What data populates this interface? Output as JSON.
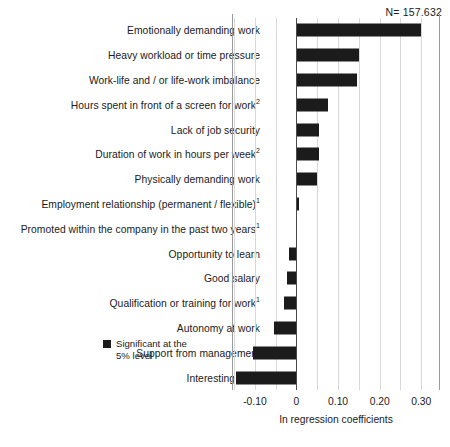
{
  "sample_note": "N= 157.632",
  "legend": {
    "label": "Significant at the 5% level",
    "color": "#1b1b1b"
  },
  "axis": {
    "x_title": "In regression coefficients",
    "x_ticks": [
      "-0.10",
      "0",
      "0.10",
      "0.20",
      "0.30"
    ]
  },
  "chart_data": {
    "type": "bar",
    "orientation": "horizontal",
    "title": "",
    "subtitle": "",
    "xlabel": "In regression coefficients",
    "ylabel": "",
    "xlim": [
      -0.155,
      0.345
    ],
    "xticks": [
      -0.1,
      0,
      0.1,
      0.2,
      0.3
    ],
    "xtick_labels": [
      "-0.10",
      "0",
      "0.10",
      "0.20",
      "0.30"
    ],
    "grid": true,
    "grid_axis": "x",
    "minor_grid_step": 0.05,
    "legend_entries": [
      "Significant at the 5% level"
    ],
    "legend_position": "bottom-right-inside",
    "annotations": [
      "N= 157.632"
    ],
    "footnote_markers": {
      "1": "superscript 1",
      "2": "superscript 2"
    },
    "bar_color": "#1b1b1b",
    "categories": [
      "Emotionally demanding work",
      "Heavy workload or time pressure",
      "Work-life and / or life-work imbalance",
      "Hours spent in front of a screen for work²",
      "Lack of job security",
      "Duration of work in hours per week²",
      "Physically demanding work",
      "Employment relationship (permanent / flexible)¹",
      "Promoted within the company in the past two years¹",
      "Opportunity to learn",
      "Good salary",
      "Qualification or training for work¹",
      "Autonomy at work",
      "Support from management",
      "Interesting work"
    ],
    "values": [
      0.3,
      0.15,
      0.145,
      0.075,
      0.055,
      0.055,
      0.05,
      0.005,
      0.0,
      -0.017,
      -0.024,
      -0.03,
      -0.055,
      -0.105,
      -0.145
    ],
    "significant": [
      true,
      true,
      true,
      true,
      true,
      true,
      true,
      true,
      false,
      true,
      true,
      true,
      true,
      true,
      true
    ]
  },
  "categories_html": [
    "Emotionally demanding work",
    "Heavy workload or time pressure",
    "Work-life and / or life-work imbalance",
    "Hours spent in front of a screen for work<sup>2</sup>",
    "Lack of job security",
    "Duration of work in hours per week<sup>2</sup>",
    "Physically demanding work",
    "Employment relationship (permanent / flexible)<sup>1</sup>",
    "Promoted within the company in the past two years<sup>1</sup>",
    "Opportunity to learn",
    "Good salary",
    "Qualification or training for work<sup>1</sup>",
    "Autonomy at work",
    "Support from management",
    "Interesting work"
  ]
}
